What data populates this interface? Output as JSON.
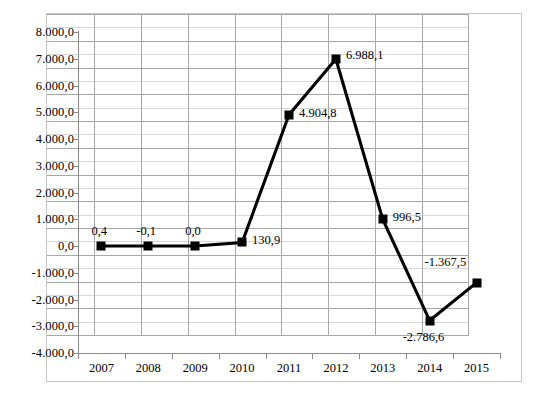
{
  "chart_data": {
    "type": "line",
    "title": "",
    "subtitle": "",
    "xlabel": "",
    "ylabel": "",
    "categories": [
      "2007",
      "2008",
      "2009",
      "2010",
      "2011",
      "2012",
      "2013",
      "2014",
      "2015"
    ],
    "values": [
      0.4,
      -0.1,
      0.0,
      130.9,
      4904.8,
      6988.1,
      996.5,
      -2786.6,
      -1367.5
    ],
    "point_labels": [
      "0,4",
      "-0,1",
      "0,0",
      "130,9",
      "4.904,8",
      "6.988,1",
      "996,5",
      "-2.786,6",
      "-1.367,5"
    ],
    "ylim": [
      -4000,
      8000
    ],
    "ytick_values": [
      8000,
      7000,
      6000,
      5000,
      4000,
      3000,
      2000,
      1000,
      0,
      -1000,
      -2000,
      -3000,
      -4000
    ],
    "ytick_labels": [
      "8.000,0",
      "7.000,0",
      "6.000,0",
      "5.000,0",
      "4.000,0",
      "3.000,0",
      "2.000,0",
      "1.000,0",
      "0,0",
      "-1.000,0",
      "-2.000,0",
      "-3.000,0",
      "-4.000,0"
    ],
    "minor_ytick_step": 500,
    "grid": true,
    "legend": false,
    "legend_position": "none",
    "series_color": "#000000",
    "marker": "square",
    "grid_color_major": "#a8a8a8",
    "grid_color_minor": "#d8d8d8",
    "frame_color": "#c9c9c9",
    "background_color": "#ffffff"
  },
  "caption": {
    "cropped_text": ""
  }
}
